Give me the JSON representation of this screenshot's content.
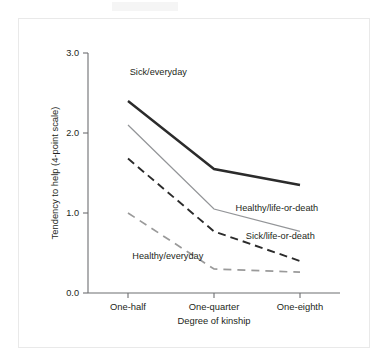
{
  "chart_data": {
    "type": "line",
    "title": "",
    "subtitle": "",
    "xlabel": "Degree of kinship",
    "ylabel": "Tendency to help (4-point scale)",
    "categories": [
      "One-half",
      "One-quarter",
      "One-eighth"
    ],
    "x": [
      0,
      1,
      2
    ],
    "ylim": [
      0.0,
      3.0
    ],
    "yticks": [
      "0.0",
      "1.0",
      "2.0",
      "3.0"
    ],
    "ytick_values": [
      0.0,
      1.0,
      2.0,
      3.0
    ],
    "grid": false,
    "legend_position": "inline-annotations",
    "series": [
      {
        "name": "Sick/everyday",
        "values": [
          2.4,
          1.55,
          1.35
        ],
        "style": "solid-thick",
        "color": "#2b2b2b",
        "label_x": 0.02,
        "label_y": 2.72
      },
      {
        "name": "Healthy/life-or-death",
        "values": [
          2.1,
          1.05,
          0.77
        ],
        "style": "solid-thin",
        "color": "#939598",
        "label_x": 1.25,
        "label_y": 1.02
      },
      {
        "name": "Sick/life-or-death",
        "values": [
          1.68,
          0.77,
          0.4
        ],
        "style": "dashed-dark",
        "color": "#2b2b2b",
        "label_x": 1.37,
        "label_y": 0.68
      },
      {
        "name": "Healthy/everyday",
        "values": [
          1.0,
          0.3,
          0.26
        ],
        "style": "dashed-gray",
        "color": "#9a9a9a",
        "label_x": 0.05,
        "label_y": 0.43
      }
    ]
  },
  "axes": {
    "y_axis_title": "Tendency to help (4-point scale)",
    "x_axis_title": "Degree of kinship"
  },
  "labels": {
    "tick_0": "0.0",
    "tick_1": "1.0",
    "tick_2": "2.0",
    "tick_3": "3.0",
    "cat_0": "One-half",
    "cat_1": "One-quarter",
    "cat_2": "One-eighth",
    "series_0": "Sick/everyday",
    "series_1": "Healthy/life-or-death",
    "series_2": "Sick/life-or-death",
    "series_3": "Healthy/everyday"
  },
  "colors": {
    "axis": "#6d6e71",
    "text": "#231f20",
    "dark_line": "#2b2b2b",
    "gray_line": "#939598",
    "background": "#ffffff",
    "panel_border": "#e9e9e9"
  }
}
